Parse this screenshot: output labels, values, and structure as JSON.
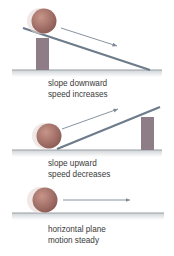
{
  "panels": [
    {
      "id": "downward",
      "caption_line1": "slope downward",
      "caption_line2": "speed increases"
    },
    {
      "id": "upward",
      "caption_line1": "slope upward",
      "caption_line2": "speed decreases"
    },
    {
      "id": "horizontal",
      "caption_line1": "horizontal plane",
      "caption_line2": "motion steady"
    }
  ],
  "colors": {
    "ball": "#9c6a62",
    "ball_highlight": "#c9958a",
    "slope": "#6d7b8a",
    "block": "#8e7c86",
    "ground": "#9aa0a6",
    "arrow": "#7b8794",
    "text": "#3a3a3a"
  }
}
